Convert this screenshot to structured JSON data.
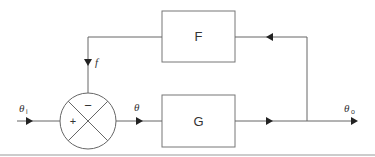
{
  "diagram": {
    "type": "feedback-control-block-diagram",
    "blocks": [
      {
        "id": "F",
        "label": "F",
        "role": "feedback"
      },
      {
        "id": "G",
        "label": "G",
        "role": "forward"
      }
    ],
    "summing_junction": {
      "plus": "+",
      "minus": "−"
    },
    "signals": {
      "input": {
        "symbol": "θ",
        "subscript": "i"
      },
      "error": {
        "symbol": "θ"
      },
      "output": {
        "symbol": "θ",
        "subscript": "o"
      },
      "feedback": {
        "symbol": "f"
      }
    },
    "colors": {
      "line": "#555555",
      "box": "#777777",
      "text": "#333333"
    }
  }
}
